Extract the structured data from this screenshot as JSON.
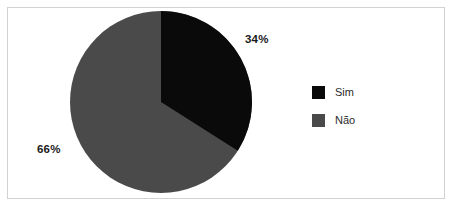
{
  "chart_data": {
    "type": "pie",
    "title": "",
    "categories": [
      "Sim",
      "Não"
    ],
    "values": [
      34,
      66
    ],
    "value_unit": "%",
    "data_labels": [
      "34%",
      "66%"
    ],
    "colors": [
      "#0a0a0a",
      "#4a4a4a"
    ],
    "legend_position": "right",
    "grid": false,
    "start_angle_deg": 0,
    "direction": "clockwise",
    "series": [
      {
        "name": "Respostas",
        "values": [
          34,
          66
        ]
      }
    ]
  },
  "figure": {
    "background_color": "#ffffff",
    "frame_color": "#d2d2d2"
  },
  "labels": {
    "sim_percent": "34%",
    "nao_percent": "66%"
  },
  "legend": {
    "items": [
      {
        "label": "Sim",
        "color": "#0a0a0a",
        "swatch_name": "legend-swatch-sim"
      },
      {
        "label": "Não",
        "color": "#4a4a4a",
        "swatch_name": "legend-swatch-nao"
      }
    ]
  }
}
